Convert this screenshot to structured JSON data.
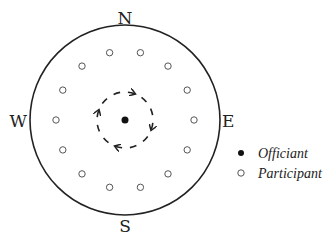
{
  "diagram": {
    "directions": {
      "north": "N",
      "south": "S",
      "east": "E",
      "west": "W"
    },
    "officiant_count": 1,
    "participant_count": 14,
    "rotation": "clockwise",
    "legend": [
      {
        "symbol": "filled-dot",
        "label": "Officiant"
      },
      {
        "symbol": "hollow-dot",
        "label": "Participant"
      }
    ],
    "colors": {
      "stroke": "#222222",
      "participant": "#555555",
      "background": "#ffffff"
    }
  }
}
